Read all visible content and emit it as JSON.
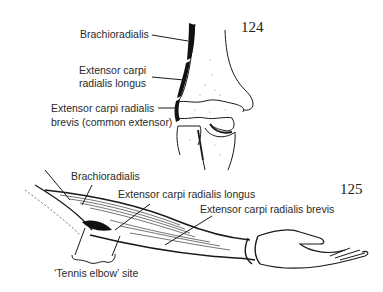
{
  "figure_124": {
    "number": "124",
    "labels": {
      "brachioradialis": "Brachioradialis",
      "ecrl_line1": "Extensor carpi",
      "ecrl_line2": "radialis longus",
      "ecrb_line1": "Extensor carpi radialis",
      "ecrb_line2": "brevis (common extensor)"
    }
  },
  "figure_125": {
    "number": "125",
    "labels": {
      "brachioradialis": "Brachioradialis",
      "ecrl": "Extensor carpi radialis longus",
      "ecrb": "Extensor carpi radialis brevis",
      "tennis_elbow": "‘Tennis elbow’ site"
    }
  },
  "colors": {
    "ink": "#1a1a1a",
    "text": "#2a2a2a",
    "background": "#ffffff"
  }
}
